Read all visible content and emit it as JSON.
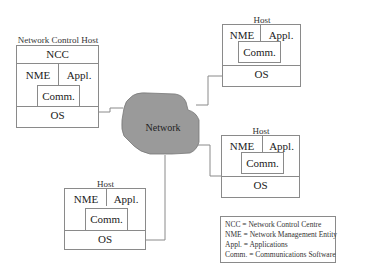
{
  "diagram": {
    "network": {
      "label": "Network",
      "fill": "#9a9a9a"
    },
    "control_host": {
      "title": "Network Control Host",
      "ncc": "NCC",
      "nme": "NME",
      "appl": "Appl.",
      "comm": "Comm.",
      "os": "OS"
    },
    "hosts": [
      {
        "title": "Host",
        "nme": "NME",
        "appl": "Appl.",
        "comm": "Comm.",
        "os": "OS"
      },
      {
        "title": "Host",
        "nme": "NME",
        "appl": "Appl.",
        "comm": "Comm.",
        "os": "OS"
      },
      {
        "title": "Host",
        "nme": "NME",
        "appl": "Appl.",
        "comm": "Comm.",
        "os": "OS"
      }
    ],
    "legend": [
      "NCC = Network Control Centre",
      "NME = Network Management Entity",
      "Appl. = Applications",
      "Comm. = Communications Software"
    ]
  }
}
